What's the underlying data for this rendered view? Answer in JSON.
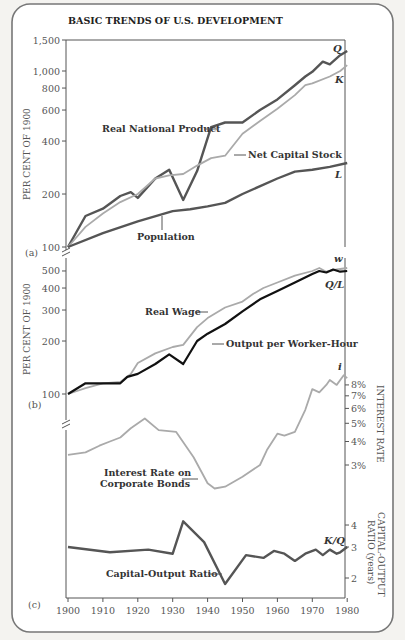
{
  "title": "BASIC TRENDS OF U.S. DEVELOPMENT",
  "colors": {
    "dark": "#555555",
    "light": "#aaaaaa",
    "black": "#111111",
    "frame": "#777777"
  },
  "chart_data": [
    {
      "panel": "(a)",
      "type": "line",
      "ylabel": "PER CENT OF 1900",
      "yscale": "log",
      "yticks": [
        100,
        200,
        400,
        600,
        800,
        1000,
        1500
      ],
      "ytick_labels": [
        "100",
        "200",
        "400",
        "600",
        "800",
        "1,000",
        "1,500"
      ],
      "xlim": [
        1900,
        1980
      ],
      "series": [
        {
          "name": "Real National Product",
          "symbol": "Q",
          "color": "dark",
          "x": [
            1900,
            1905,
            1910,
            1915,
            1918,
            1920,
            1925,
            1929,
            1933,
            1937,
            1941,
            1945,
            1950,
            1955,
            1960,
            1965,
            1968,
            1970,
            1973,
            1975,
            1978,
            1980
          ],
          "y": [
            100,
            150,
            165,
            195,
            205,
            190,
            245,
            275,
            185,
            270,
            480,
            510,
            510,
            600,
            690,
            830,
            930,
            990,
            1130,
            1090,
            1230,
            1300
          ]
        },
        {
          "name": "Net Capital Stock",
          "symbol": "K",
          "color": "light",
          "x": [
            1900,
            1905,
            1910,
            1915,
            1920,
            1925,
            1929,
            1933,
            1937,
            1941,
            1945,
            1950,
            1955,
            1960,
            1965,
            1968,
            1970,
            1975,
            1978,
            1980
          ],
          "y": [
            100,
            130,
            155,
            180,
            200,
            245,
            255,
            260,
            290,
            320,
            330,
            440,
            520,
            610,
            730,
            830,
            850,
            930,
            1000,
            1080
          ]
        },
        {
          "name": "Population",
          "symbol": "L",
          "color": "dark",
          "x": [
            1900,
            1910,
            1920,
            1930,
            1935,
            1940,
            1945,
            1950,
            1960,
            1965,
            1970,
            1975,
            1980
          ],
          "y": [
            100,
            120,
            140,
            160,
            164,
            170,
            178,
            200,
            245,
            268,
            275,
            285,
            300
          ]
        }
      ]
    },
    {
      "panel": "(b)",
      "type": "line",
      "ylabel": "PER CENT OF 1900",
      "yscale": "log",
      "yticks": [
        100,
        200,
        300,
        400,
        500
      ],
      "xlim": [
        1900,
        1980
      ],
      "series": [
        {
          "name": "Real Wage",
          "symbol": "w",
          "color": "light",
          "x": [
            1900,
            1905,
            1910,
            1915,
            1918,
            1920,
            1925,
            1930,
            1933,
            1937,
            1940,
            1945,
            1950,
            1953,
            1956,
            1960,
            1965,
            1970,
            1972,
            1974,
            1977,
            1980
          ],
          "y": [
            100,
            108,
            115,
            117,
            130,
            150,
            170,
            185,
            190,
            240,
            270,
            310,
            335,
            370,
            400,
            430,
            470,
            500,
            520,
            495,
            510,
            520
          ]
        },
        {
          "name": "Output per Worker-Hour",
          "symbol": "Q/L",
          "color": "black",
          "x": [
            1900,
            1905,
            1910,
            1915,
            1917,
            1920,
            1925,
            1929,
            1933,
            1937,
            1940,
            1945,
            1950,
            1955,
            1960,
            1965,
            1970,
            1972,
            1974,
            1976,
            1978,
            1980
          ],
          "y": [
            100,
            115,
            115,
            115,
            125,
            130,
            148,
            168,
            148,
            200,
            220,
            250,
            295,
            345,
            385,
            430,
            480,
            500,
            490,
            510,
            495,
            500
          ]
        }
      ]
    },
    {
      "panel": "(b)",
      "type": "line",
      "ylabel_right": "INTEREST RATE",
      "yscale": "log",
      "yticks": [
        3,
        4,
        5,
        6,
        7,
        8
      ],
      "ytick_labels": [
        "3%",
        "4%",
        "5%",
        "6%",
        "7%",
        "8%"
      ],
      "xlim": [
        1900,
        1980
      ],
      "series": [
        {
          "name": "Interest Rate on Corporate Bonds",
          "symbol": "i",
          "color": "light",
          "x": [
            1900,
            1905,
            1909,
            1912,
            1915,
            1918,
            1922,
            1926,
            1931,
            1936,
            1940,
            1942,
            1945,
            1950,
            1955,
            1957,
            1960,
            1962,
            1965,
            1968,
            1970,
            1972,
            1974,
            1975,
            1977,
            1979,
            1980
          ],
          "y": [
            3.4,
            3.5,
            3.8,
            4.0,
            4.2,
            4.7,
            5.3,
            4.6,
            4.5,
            3.3,
            2.4,
            2.25,
            2.3,
            2.6,
            3.0,
            3.6,
            4.4,
            4.3,
            4.5,
            5.9,
            7.6,
            7.3,
            8.0,
            8.5,
            8.0,
            9.0,
            8.7
          ]
        }
      ]
    },
    {
      "panel": "(c)",
      "type": "line",
      "ylabel_right": "CAPITAL-OUTPUT RATIO (years)",
      "yscale": "log",
      "yticks": [
        2,
        3,
        4
      ],
      "xlim": [
        1900,
        1980
      ],
      "xticks": [
        1900,
        1910,
        1920,
        1930,
        1940,
        1950,
        1960,
        1970,
        1980
      ],
      "series": [
        {
          "name": "Capital-Output Ratio",
          "symbol": "K/Q",
          "color": "dark",
          "x": [
            1900,
            1912,
            1923,
            1930,
            1933,
            1939,
            1945,
            1951,
            1956,
            1959,
            1962,
            1965,
            1968,
            1971,
            1973,
            1975,
            1977,
            1978,
            1980
          ],
          "y": [
            3.0,
            2.8,
            2.9,
            2.75,
            4.2,
            3.2,
            1.85,
            2.7,
            2.6,
            2.85,
            2.75,
            2.5,
            2.75,
            2.9,
            2.7,
            2.9,
            2.75,
            2.8,
            3.0
          ]
        }
      ]
    }
  ],
  "labels": {
    "real_national_product": "Real National Product",
    "net_capital_stock": "Net Capital Stock",
    "population": "Population",
    "real_wage": "Real Wage",
    "output_per_worker_hour": "Output per Worker-Hour",
    "interest_rate_line1": "Interest Rate on",
    "interest_rate_line2": "Corporate Bonds",
    "capital_output_ratio": "Capital-Output Ratio",
    "panel_a": "(a)",
    "panel_b": "(b)",
    "panel_c": "(c)",
    "ylabel_left": "PER CENT OF 1900",
    "ylabel_interest": "INTEREST RATE",
    "ylabel_ratio_1": "CAPITAL-OUTPUT",
    "ylabel_ratio_2": "RATIO (years)",
    "sym_Q": "Q",
    "sym_K": "K",
    "sym_L": "L",
    "sym_w": "w",
    "sym_QL": "Q/L",
    "sym_i": "i",
    "sym_KQ": "K/Q"
  }
}
